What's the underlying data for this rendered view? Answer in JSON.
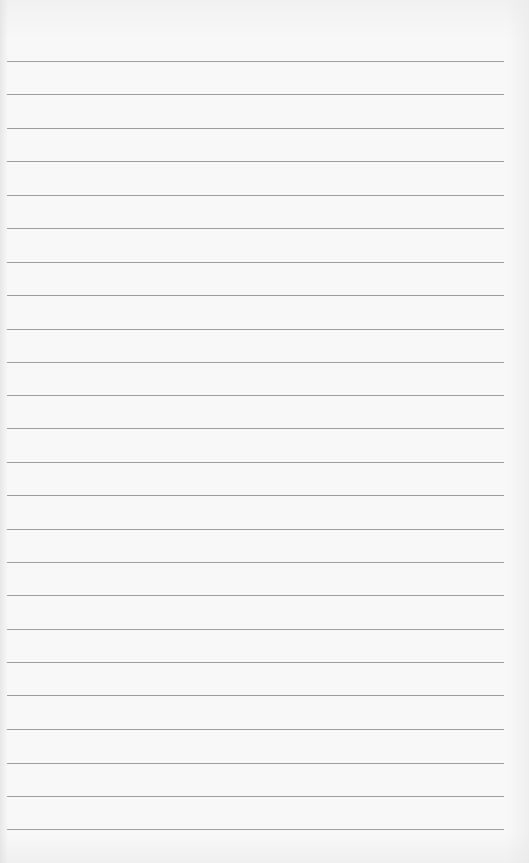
{
  "paper": {
    "background_color": "#f8f8f8",
    "line_color": "#8e8e8e",
    "line_left": 7,
    "line_right": 504,
    "lines_y": [
      61,
      94,
      128,
      161,
      195,
      228,
      262,
      295,
      329,
      362,
      395,
      428,
      462,
      495,
      529,
      562,
      595,
      629,
      662,
      695,
      729,
      763,
      796,
      829
    ]
  }
}
